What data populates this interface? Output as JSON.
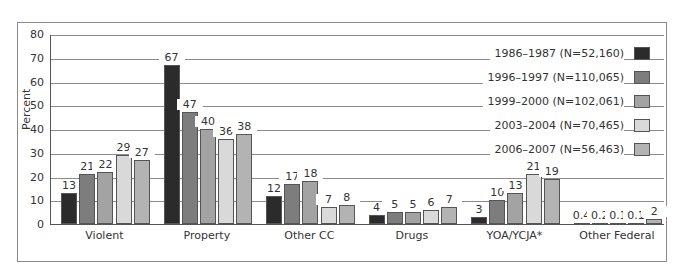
{
  "chart_data": {
    "type": "bar",
    "title": "",
    "xlabel": "",
    "ylabel": "Percent",
    "ylim": [
      0,
      80
    ],
    "yticks": [
      0,
      10,
      20,
      30,
      40,
      50,
      60,
      70,
      80
    ],
    "grid": true,
    "legend_position": "top-right",
    "categories": [
      "Violent",
      "Property",
      "Other CC",
      "Drugs",
      "YOA/YCJA*",
      "Other Federal"
    ],
    "series": [
      {
        "name": "1986–1987 (N=52,160)",
        "color": "#2b2b2b",
        "values": [
          13,
          67,
          12,
          4,
          3,
          0.4
        ]
      },
      {
        "name": "1996–1997 (N=110,065)",
        "color": "#7d7d7d",
        "values": [
          21,
          47,
          17,
          5,
          10,
          0.2
        ]
      },
      {
        "name": "1999–2000 (N=102,061)",
        "color": "#a3a3a3",
        "values": [
          22,
          40,
          18,
          5,
          13,
          0.1
        ]
      },
      {
        "name": "2003–2004 (N=70,465)",
        "color": "#d9d9d9",
        "values": [
          29,
          36,
          7,
          6,
          21,
          0.1
        ]
      },
      {
        "name": "2006–2007 (N=56,463)",
        "color": "#b3b3b3",
        "values": [
          27,
          38,
          8,
          7,
          19,
          2
        ]
      }
    ],
    "value_labels": [
      [
        "13",
        "67",
        "12",
        "4",
        "3",
        "0.4"
      ],
      [
        "21",
        "47",
        "17",
        "5",
        "10",
        "0.2"
      ],
      [
        "22",
        "40",
        "18",
        "5",
        "13",
        "0.1"
      ],
      [
        "29",
        "36",
        "7",
        "6",
        "21",
        "0.1"
      ],
      [
        "27",
        "38",
        "8",
        "7",
        "19",
        "2"
      ]
    ]
  }
}
